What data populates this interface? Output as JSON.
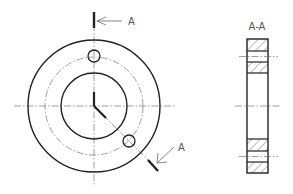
{
  "drawing": {
    "type": "technical-engineering-drawing",
    "views": [
      "front-view",
      "section-view"
    ],
    "section_marker_top": "A",
    "section_marker_bottom": "A",
    "section_view_title": "A-A"
  },
  "colors": {
    "line": "#222222",
    "center_line": "#777777",
    "label": "#555555",
    "background": "#ffffff"
  }
}
